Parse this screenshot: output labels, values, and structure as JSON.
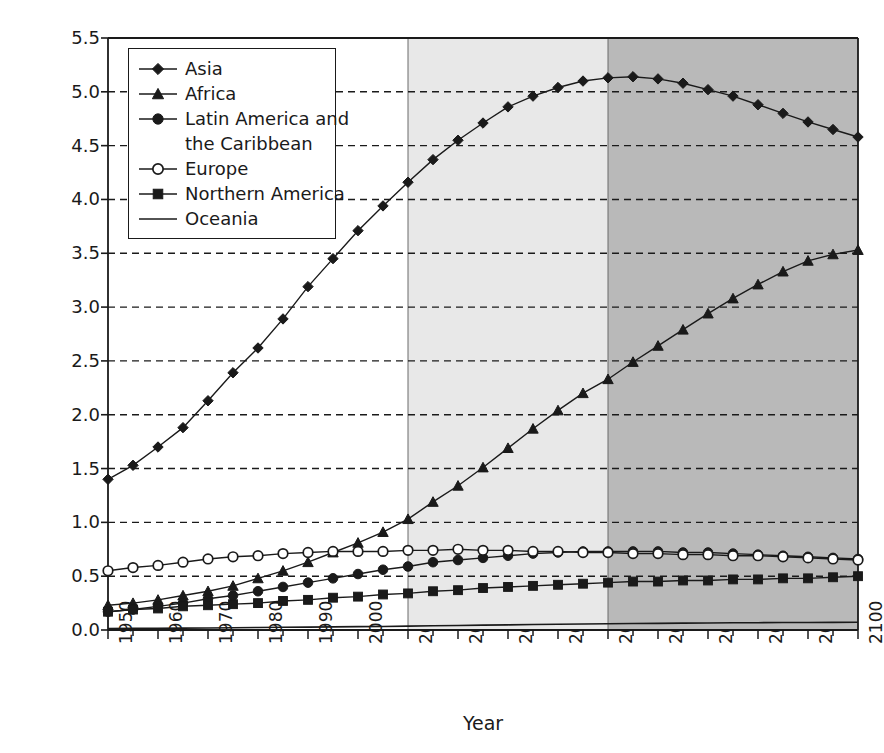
{
  "chart_data": {
    "type": "line",
    "title": "",
    "xlabel": "Year",
    "ylabel": "Estimated and projected population (billions)",
    "xlim": [
      1950,
      2100
    ],
    "ylim": [
      0.0,
      5.5
    ],
    "ytick_labels": [
      "0.0",
      "0.5",
      "1.0",
      "1.5",
      "2.0",
      "2.5",
      "3.0",
      "3.5",
      "4.0",
      "4.5",
      "5.0",
      "5.5"
    ],
    "ytick_values": [
      0.0,
      0.5,
      1.0,
      1.5,
      2.0,
      2.5,
      3.0,
      3.5,
      4.0,
      4.5,
      5.0,
      5.5
    ],
    "xtick_labels": [
      "1950",
      "1960",
      "1970",
      "1980",
      "1990",
      "2000",
      "2010",
      "2020",
      "2030",
      "2040",
      "2050",
      "2060",
      "2070",
      "2080",
      "2090",
      "2100"
    ],
    "xtick_values": [
      1950,
      1960,
      1970,
      1980,
      1990,
      2000,
      2010,
      2020,
      2030,
      2040,
      2050,
      2060,
      2070,
      2080,
      2090,
      2100
    ],
    "minor_xtick_step": 5,
    "grid": "horizontal-dashed",
    "legend_position": "upper-left-inside",
    "x": [
      1950,
      1955,
      1960,
      1965,
      1970,
      1975,
      1980,
      1985,
      1990,
      1995,
      2000,
      2005,
      2010,
      2015,
      2020,
      2025,
      2030,
      2035,
      2040,
      2045,
      2050,
      2055,
      2060,
      2065,
      2070,
      2075,
      2080,
      2085,
      2090,
      2095,
      2100
    ],
    "shaded_bands": [
      {
        "name": "estimates",
        "from": 1950,
        "to": 2010,
        "color": "#ffffff"
      },
      {
        "name": "projection-near",
        "from": 2010,
        "to": 2050,
        "color": "#e8e8e8"
      },
      {
        "name": "projection-far",
        "from": 2050,
        "to": 2100,
        "color": "#b9b9b9"
      }
    ],
    "series": [
      {
        "name": "Asia",
        "marker": "filled-diamond",
        "values": [
          1.4,
          1.53,
          1.7,
          1.88,
          2.13,
          2.39,
          2.62,
          2.89,
          3.19,
          3.45,
          3.71,
          3.94,
          4.16,
          4.37,
          4.55,
          4.71,
          4.86,
          4.96,
          5.04,
          5.1,
          5.13,
          5.14,
          5.12,
          5.08,
          5.02,
          4.96,
          4.88,
          4.8,
          4.72,
          4.65,
          4.58
        ]
      },
      {
        "name": "Africa",
        "marker": "filled-triangle",
        "values": [
          0.23,
          0.25,
          0.28,
          0.32,
          0.36,
          0.41,
          0.48,
          0.55,
          0.63,
          0.72,
          0.81,
          0.91,
          1.03,
          1.19,
          1.34,
          1.51,
          1.69,
          1.87,
          2.04,
          2.2,
          2.33,
          2.49,
          2.64,
          2.79,
          2.94,
          3.08,
          3.21,
          3.33,
          3.43,
          3.49,
          3.53
        ]
      },
      {
        "name": "Latin America and the Caribbean",
        "marker": "filled-circle",
        "values": [
          0.17,
          0.19,
          0.22,
          0.25,
          0.29,
          0.32,
          0.36,
          0.4,
          0.44,
          0.48,
          0.52,
          0.56,
          0.59,
          0.63,
          0.65,
          0.67,
          0.69,
          0.71,
          0.72,
          0.73,
          0.73,
          0.73,
          0.73,
          0.72,
          0.72,
          0.71,
          0.7,
          0.69,
          0.68,
          0.67,
          0.66
        ]
      },
      {
        "name": "Europe",
        "marker": "open-circle",
        "values": [
          0.55,
          0.58,
          0.6,
          0.63,
          0.66,
          0.68,
          0.69,
          0.71,
          0.72,
          0.73,
          0.73,
          0.73,
          0.74,
          0.74,
          0.75,
          0.74,
          0.74,
          0.73,
          0.73,
          0.72,
          0.72,
          0.71,
          0.71,
          0.7,
          0.7,
          0.69,
          0.69,
          0.68,
          0.67,
          0.66,
          0.65
        ]
      },
      {
        "name": "Northern America",
        "marker": "filled-square",
        "values": [
          0.17,
          0.19,
          0.2,
          0.22,
          0.23,
          0.24,
          0.25,
          0.27,
          0.28,
          0.3,
          0.31,
          0.33,
          0.34,
          0.36,
          0.37,
          0.39,
          0.4,
          0.41,
          0.42,
          0.43,
          0.44,
          0.45,
          0.45,
          0.46,
          0.46,
          0.47,
          0.47,
          0.48,
          0.48,
          0.49,
          0.5
        ]
      },
      {
        "name": "Oceania",
        "marker": "line-only",
        "values": [
          0.013,
          0.015,
          0.016,
          0.017,
          0.019,
          0.021,
          0.023,
          0.025,
          0.027,
          0.029,
          0.031,
          0.033,
          0.036,
          0.039,
          0.042,
          0.045,
          0.048,
          0.051,
          0.053,
          0.056,
          0.058,
          0.06,
          0.062,
          0.064,
          0.065,
          0.067,
          0.068,
          0.069,
          0.07,
          0.071,
          0.072
        ]
      }
    ]
  },
  "legend": {
    "entries": [
      {
        "label": "Asia",
        "marker": "filled-diamond"
      },
      {
        "label": "Africa",
        "marker": "filled-triangle"
      },
      {
        "label": "Latin America and",
        "marker": "filled-circle"
      },
      {
        "label": "the Caribbean",
        "marker": "none"
      },
      {
        "label": "Europe",
        "marker": "open-circle"
      },
      {
        "label": "Northern America",
        "marker": "filled-square"
      },
      {
        "label": "Oceania",
        "marker": "line-only"
      }
    ]
  },
  "colors": {
    "ink": "#1a1a1a",
    "band_light": "#e8e8e8",
    "band_dark": "#b9b9b9",
    "background": "#ffffff"
  }
}
